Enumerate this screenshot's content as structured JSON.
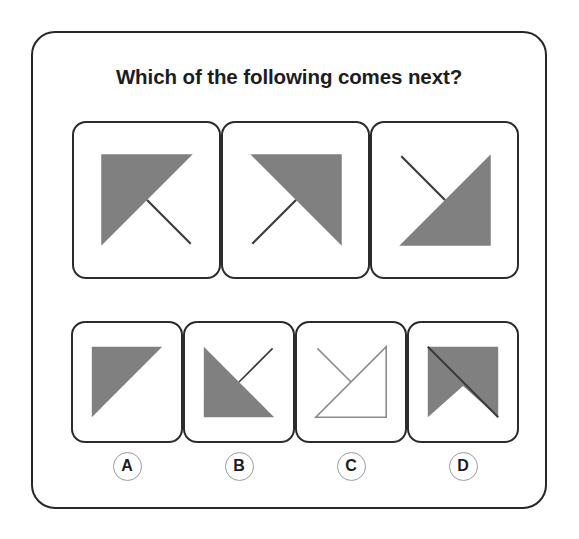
{
  "card": {
    "title": "Which of the following comes next?",
    "border_color": "#262626",
    "background": "#ffffff"
  },
  "style": {
    "fill_gray": "#808080",
    "stroke_dark": "#3a3a3a",
    "stroke_light": "#8c8c8c",
    "panel_border": "#2b2b2b",
    "label_ring": "#9a9a9a",
    "text_color": "#1d1d1f"
  },
  "sequence": {
    "name": "sequence-row",
    "panels": [
      {
        "id": "sequence-panel-1",
        "position": 1,
        "shape": "filled-triangle",
        "filled": true,
        "triangle_corners": "top-left, top-right, bottom-left",
        "line": "center to bottom-right",
        "line_color": "#3a3a3a"
      },
      {
        "id": "sequence-panel-2",
        "position": 2,
        "shape": "filled-triangle",
        "filled": true,
        "triangle_corners": "top-left, top-right, bottom-right",
        "line": "center to bottom-left",
        "line_color": "#3a3a3a"
      },
      {
        "id": "sequence-panel-3",
        "position": 3,
        "shape": "filled-triangle",
        "filled": true,
        "triangle_corners": "top-right, bottom-right, bottom-left",
        "line": "center to top-left",
        "line_color": "#3a3a3a"
      }
    ]
  },
  "options": {
    "name": "answer-options",
    "items": [
      {
        "id": "option-a",
        "label": "A",
        "shape": "filled-triangle",
        "filled": true,
        "triangle_corners": "top-left, top-right, bottom-left",
        "line": "none"
      },
      {
        "id": "option-b",
        "label": "B",
        "shape": "filled-triangle",
        "filled": true,
        "triangle_corners": "top-left, bottom-left, bottom-right",
        "line": "center to top-right",
        "line_color": "#3a3a3a"
      },
      {
        "id": "option-c",
        "label": "C",
        "shape": "outline-triangle",
        "filled": false,
        "triangle_corners": "top-right, bottom-right, bottom-left",
        "line": "center to top-left",
        "line_color": "#8c8c8c"
      },
      {
        "id": "option-d",
        "label": "D",
        "shape": "notched-square",
        "filled": true,
        "triangle_corners": "square with bottom-center notch",
        "line": "top-left to bottom-right diagonal",
        "line_color": "#3a3a3a"
      }
    ]
  }
}
